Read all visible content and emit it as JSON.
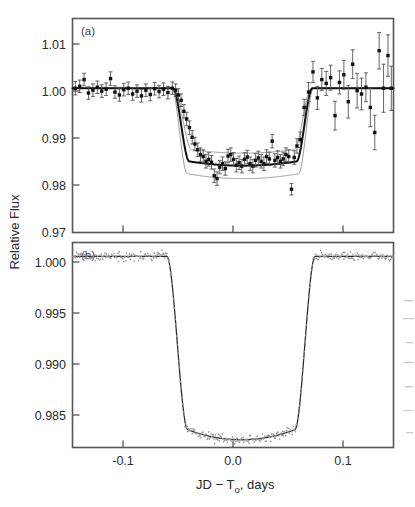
{
  "figure": {
    "title": "",
    "y_axis_label": "Relative Flux",
    "x_axis_label_prefix": "JD − T",
    "x_axis_label_sub": "o",
    "x_axis_label_suffix": ", days",
    "x_axis_label_full": "JD − To, days",
    "panel_a_label": "(a)",
    "panel_b_label": "(b)"
  },
  "chart_data": [
    {
      "type": "scatter",
      "panel": "(a)",
      "title": "",
      "xlabel": "JD − To, days",
      "ylabel": "Relative Flux",
      "xlim": [
        -0.1455,
        0.1455
      ],
      "ylim": [
        0.97,
        1.0145
      ],
      "xticks": [
        -0.1,
        0.0,
        0.1
      ],
      "xtick_labels": [
        "",
        "",
        ""
      ],
      "yticks": [
        0.97,
        0.98,
        0.99,
        1.0,
        1.01
      ],
      "ytick_labels": [
        "0.97",
        "0.98",
        "0.99",
        "1.00",
        "1.01"
      ],
      "grid": false,
      "legend": "none",
      "annotations": [
        "(a)"
      ],
      "series": [
        {
          "name": "photometry",
          "marker": "filled-square-with-errorbars",
          "x": [
            -0.143,
            -0.139,
            -0.135,
            -0.131,
            -0.127,
            -0.123,
            -0.119,
            -0.115,
            -0.111,
            -0.107,
            -0.103,
            -0.099,
            -0.095,
            -0.091,
            -0.087,
            -0.083,
            -0.079,
            -0.075,
            -0.071,
            -0.067,
            -0.063,
            -0.059,
            -0.055,
            -0.052,
            -0.0495,
            -0.047,
            -0.0445,
            -0.042,
            -0.0395,
            -0.037,
            -0.0345,
            -0.032,
            -0.0295,
            -0.027,
            -0.0245,
            -0.022,
            -0.0195,
            -0.017,
            -0.0145,
            -0.012,
            -0.0095,
            -0.007,
            -0.0045,
            -0.002,
            0.0005,
            0.003,
            0.0055,
            0.008,
            0.0105,
            0.013,
            0.0155,
            0.018,
            0.0205,
            0.023,
            0.0255,
            0.028,
            0.0305,
            0.033,
            0.0355,
            0.038,
            0.0405,
            0.043,
            0.0455,
            0.048,
            0.0505,
            0.053,
            0.0555,
            0.058,
            0.061,
            0.0645,
            0.0685,
            0.0725,
            0.0765,
            0.0805,
            0.0845,
            0.0885,
            0.0925,
            0.0965,
            0.1005,
            0.1045,
            0.1085,
            0.1125,
            0.1165,
            0.1205,
            0.1245,
            0.1285,
            0.1325,
            0.1365,
            0.1405,
            0.1435
          ],
          "y": [
            1.0,
            1.0004,
            1.0018,
            0.999,
            0.9996,
            1.0002,
            0.9994,
            0.9998,
            1.002,
            0.9992,
            0.9986,
            0.9997,
            1.0,
            0.9988,
            0.9994,
            0.9984,
            0.9996,
            0.9987,
            0.9999,
            0.9993,
            0.9998,
            0.9991,
            1.0,
            0.9996,
            0.9986,
            0.9975,
            0.9952,
            0.9936,
            0.9918,
            0.9898,
            0.9884,
            0.9872,
            0.9862,
            0.9858,
            0.9848,
            0.9852,
            0.9846,
            0.9818,
            0.9812,
            0.9836,
            0.9843,
            0.9833,
            0.9859,
            0.9862,
            0.9852,
            0.984,
            0.9845,
            0.9838,
            0.9852,
            0.9857,
            0.9843,
            0.9838,
            0.985,
            0.9855,
            0.9848,
            0.9843,
            0.9858,
            0.9853,
            0.989,
            0.985,
            0.9856,
            0.9848,
            0.9853,
            0.9862,
            0.9858,
            0.979,
            0.9856,
            0.988,
            0.9893,
            0.996,
            0.9992,
            1.0034,
            0.998,
            1.0018,
            1.001,
            1.0022,
            0.9943,
            1.0012,
            1.0028,
            0.9972,
            1.005,
            0.9995,
            0.9988,
            1.0002,
            0.996,
            0.9908,
            1.0078,
            1.0,
            1.0068,
            1.0
          ],
          "yerr": [
            0.0014,
            0.0013,
            0.0013,
            0.0013,
            0.0013,
            0.0013,
            0.0013,
            0.0013,
            0.0014,
            0.0013,
            0.0013,
            0.0013,
            0.0013,
            0.0013,
            0.0013,
            0.0013,
            0.0013,
            0.0013,
            0.0013,
            0.0013,
            0.0013,
            0.0013,
            0.0013,
            0.0013,
            0.0013,
            0.0013,
            0.0014,
            0.0014,
            0.0014,
            0.0014,
            0.0014,
            0.0014,
            0.0014,
            0.0014,
            0.0014,
            0.0014,
            0.0014,
            0.0014,
            0.0014,
            0.0014,
            0.0014,
            0.0014,
            0.0014,
            0.0014,
            0.0014,
            0.0014,
            0.0014,
            0.0014,
            0.0014,
            0.0014,
            0.0014,
            0.0014,
            0.0014,
            0.0014,
            0.0014,
            0.0014,
            0.0014,
            0.0014,
            0.0014,
            0.0014,
            0.0014,
            0.0014,
            0.0014,
            0.0014,
            0.0014,
            0.0012,
            0.0014,
            0.0015,
            0.0016,
            0.0017,
            0.002,
            0.0022,
            0.0024,
            0.0023,
            0.0025,
            0.0026,
            0.003,
            0.0024,
            0.003,
            0.0034,
            0.003,
            0.0036,
            0.0033,
            0.003,
            0.004,
            0.0036,
            0.0038,
            0.005,
            0.0043,
            0.0046
          ]
        },
        {
          "name": "best-fit model",
          "marker": "line",
          "style": "thick-black",
          "transit_center": 0.0,
          "depth": 0.0161,
          "ingress_start": -0.0545,
          "ingress_end": -0.0395,
          "egress_start": 0.0575,
          "egress_end": 0.072
        },
        {
          "name": "upper confidence bound",
          "marker": "line",
          "style": "thin-gray",
          "depth": 0.0135
        },
        {
          "name": "lower confidence bound",
          "marker": "line",
          "style": "thin-gray",
          "depth": 0.0188
        }
      ]
    },
    {
      "type": "scatter",
      "panel": "(b)",
      "title": "",
      "xlabel": "JD − To, days",
      "ylabel": "Relative Flux",
      "xlim": [
        -0.1455,
        0.1455
      ],
      "ylim": [
        0.98275,
        1.00125
      ],
      "xticks": [
        -0.1,
        0.0,
        0.1
      ],
      "xtick_labels": [
        "-0.1",
        "0.0",
        "0.1"
      ],
      "yticks": [
        0.985,
        0.99,
        0.995,
        1.0
      ],
      "ytick_labels": [
        "0.985",
        "0.990",
        "0.995",
        "1.000"
      ],
      "grid": false,
      "legend": "none",
      "annotations": [
        "(b)"
      ],
      "series": [
        {
          "name": "high-precision photometry",
          "marker": "small-open-gray-dots",
          "n_points": 430,
          "scatter_rms": 0.00035,
          "baseline": 1.0
        },
        {
          "name": "best-fit model",
          "marker": "line",
          "style": "thin-black",
          "transit_center": 0.0,
          "depth": 0.01655,
          "ingress_start": -0.06,
          "ingress_end": -0.041,
          "egress_start": 0.056,
          "egress_end": 0.0745
        }
      ]
    }
  ]
}
